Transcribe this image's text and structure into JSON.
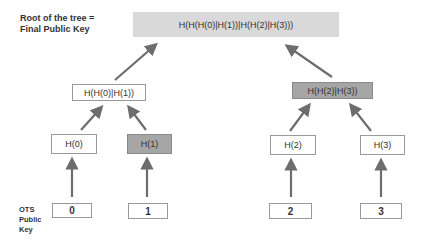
{
  "labels": {
    "root_label_line1": "Root of the tree =",
    "root_label_line2": "Final Public Key",
    "ots_line1": "OTS",
    "ots_line2": "Public",
    "ots_line3": "Key"
  },
  "tree": {
    "root": "H(H(H(0)|H(1))|H(H(2)|H(3)))",
    "level1": [
      "H(H(0)|H(1))",
      "H(H(2)|H(3))"
    ],
    "level2": [
      "H(0)",
      "H(1)",
      "H(2)",
      "H(3)"
    ],
    "leaves": [
      "0",
      "1",
      "2",
      "3"
    ],
    "highlighted": [
      "H(1)",
      "H(H(2)|H(3))"
    ]
  },
  "colors": {
    "root_fill": "#d9d9d9",
    "highlight_fill": "#a6a6a6",
    "arrow": "#6d6d6d"
  }
}
